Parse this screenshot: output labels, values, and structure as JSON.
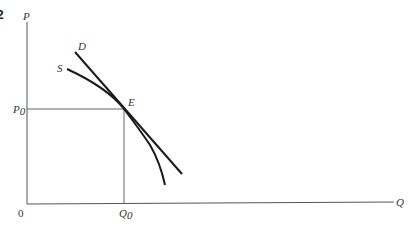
{
  "figure": {
    "number_fragment": "2"
  },
  "axes": {
    "y_label": "P",
    "x_label": "Q",
    "origin_label": "0"
  },
  "markers": {
    "price_label": "P",
    "price_subscript": "0",
    "quantity_label": "Q",
    "quantity_subscript": "0",
    "equilibrium_label": "E"
  },
  "curves": {
    "demand_label": "D",
    "supply_label": "S"
  },
  "colors": {
    "axis": "#555555",
    "curve": "#1a1a1a",
    "guide": "#666666",
    "text": "#333333"
  }
}
